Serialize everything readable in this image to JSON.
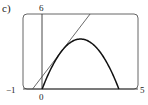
{
  "panel_label": "c)",
  "chart_data": {
    "type": "line",
    "title": "",
    "xlabel": "",
    "ylabel": "",
    "xlim": [
      -1,
      5
    ],
    "ylim": [
      0,
      6
    ],
    "tick_labels": {
      "x_min": "−1",
      "x_origin": "0",
      "x_max": "5",
      "y_max": "6"
    },
    "grid": false,
    "series": [
      {
        "name": "parabola",
        "expression": "y = 4x - x^2",
        "x": [
          0,
          0.5,
          1,
          1.5,
          2,
          2.5,
          3,
          3.5,
          4
        ],
        "y": [
          0,
          1.75,
          3,
          3.75,
          4,
          3.75,
          3,
          1.75,
          0
        ]
      },
      {
        "name": "tangent line",
        "expression": "y = 2x + 1",
        "x": [
          -0.5,
          2.5
        ],
        "y": [
          0,
          6
        ]
      }
    ],
    "annotations": [
      {
        "type": "tangent_point",
        "x": 1,
        "y": 3
      }
    ]
  }
}
